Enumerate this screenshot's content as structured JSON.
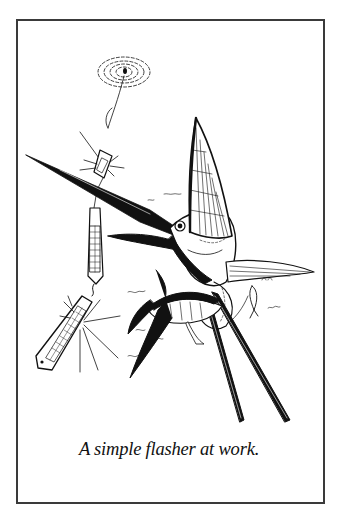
{
  "figure": {
    "caption": "A simple flasher at work.",
    "illustration": {
      "subject": "sailfish-attacking-flasher",
      "elements": [
        "spinner-swirl",
        "leader-line",
        "small-flasher-lure",
        "large-flasher-lure",
        "flasher-sparkle",
        "sailfish",
        "tuna",
        "baitfish",
        "water-ripples"
      ]
    },
    "colors": {
      "ink": "#111111",
      "frame_border": "#3a3a3a",
      "background": "#ffffff"
    }
  }
}
